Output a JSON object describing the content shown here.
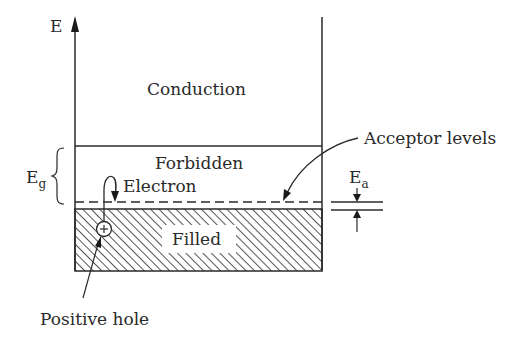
{
  "diagram": {
    "axis_label": "E",
    "regions": {
      "conduction": "Conduction",
      "forbidden": "Forbidden",
      "filled": "Filled"
    },
    "labels": {
      "electron": "Electron",
      "acceptor_levels": "Acceptor levels",
      "positive_hole": "Positive hole",
      "eg_main": "E",
      "eg_sub": "g",
      "ea_main": "E",
      "ea_sub": "a",
      "hole_symbol": "+"
    },
    "colors": {
      "line": "#2a2a2a",
      "background": "#ffffff"
    }
  }
}
